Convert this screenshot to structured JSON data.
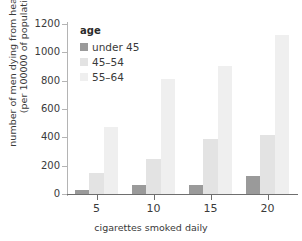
{
  "chart_data": {
    "type": "bar",
    "title": "",
    "subtitle": "",
    "xlabel": "cigarettes smoked daily",
    "ylabel_line1": "number of men dying from heart disease",
    "ylabel_line2": "(per 100000 of population)",
    "categories": [
      "5",
      "10",
      "15",
      "20"
    ],
    "series": [
      {
        "name": "under 45",
        "color": "#9a9a9a",
        "values": [
          30,
          65,
          65,
          125
        ]
      },
      {
        "name": "45–54",
        "color": "#e3e3e3",
        "values": [
          150,
          245,
          390,
          415
        ]
      },
      {
        "name": "55–64",
        "color": "#efefef",
        "values": [
          470,
          815,
          905,
          1120
        ]
      }
    ],
    "ylim": [
      0,
      1200
    ],
    "yticks": [
      0,
      200,
      400,
      600,
      800,
      1000,
      1200
    ],
    "ytick_labels": [
      "0",
      "200",
      "400",
      "600",
      "800",
      "1000",
      "1200"
    ],
    "xtick_labels": [
      "5",
      "10",
      "15",
      "20"
    ],
    "grid": false,
    "legend": {
      "title": "age",
      "position": "top-left"
    }
  }
}
